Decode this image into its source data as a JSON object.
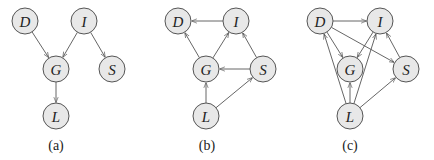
{
  "figure": {
    "node_fill": "#e8e8e8",
    "node_stroke": "#555555",
    "node_radius": 13,
    "diagrams": [
      {
        "id": "a",
        "caption": "(a)",
        "caption_pos": [
          56,
          150
        ],
        "nodes": {
          "D": [
            25,
            21
          ],
          "I": [
            84,
            21
          ],
          "G": [
            56,
            69
          ],
          "S": [
            112,
            69
          ],
          "L": [
            56,
            116
          ]
        },
        "edges": [
          [
            "D",
            "G"
          ],
          [
            "I",
            "G"
          ],
          [
            "I",
            "S"
          ],
          [
            "G",
            "L"
          ]
        ]
      },
      {
        "id": "b",
        "caption": "(b)",
        "caption_pos": [
          207,
          150
        ],
        "nodes": {
          "D": [
            178,
            21
          ],
          "I": [
            236,
            21
          ],
          "G": [
            206,
            69
          ],
          "S": [
            263,
            69
          ],
          "L": [
            206,
            116
          ]
        },
        "edges": [
          [
            "I",
            "D"
          ],
          [
            "G",
            "D"
          ],
          [
            "G",
            "I"
          ],
          [
            "S",
            "I"
          ],
          [
            "S",
            "G"
          ],
          [
            "L",
            "G"
          ],
          [
            "L",
            "S"
          ]
        ]
      },
      {
        "id": "c",
        "caption": "(c)",
        "caption_pos": [
          350,
          150
        ],
        "nodes": {
          "D": [
            320,
            21
          ],
          "I": [
            380,
            21
          ],
          "G": [
            350,
            69
          ],
          "S": [
            406,
            69
          ],
          "L": [
            350,
            116
          ]
        },
        "edges": [
          [
            "D",
            "I"
          ],
          [
            "D",
            "G"
          ],
          [
            "D",
            "S"
          ],
          [
            "I",
            "G"
          ],
          [
            "S",
            "I"
          ],
          [
            "L",
            "D"
          ],
          [
            "L",
            "G"
          ],
          [
            "L",
            "I"
          ],
          [
            "L",
            "S"
          ]
        ]
      }
    ]
  }
}
